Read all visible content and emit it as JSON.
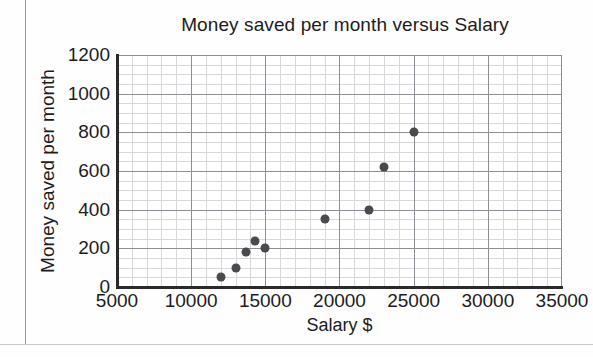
{
  "chart_data": {
    "type": "scatter",
    "title": "Money saved per month versus Salary",
    "xlabel": "Salary $",
    "ylabel": "Money saved per month",
    "xlim": [
      5000,
      35000
    ],
    "ylim": [
      0,
      1200
    ],
    "xticks": [
      "5000",
      "10000",
      "15000",
      "20000",
      "25000",
      "30000",
      "35000"
    ],
    "xtick_values": [
      5000,
      10000,
      15000,
      20000,
      25000,
      30000,
      35000
    ],
    "yticks": [
      "0",
      "200",
      "400",
      "600",
      "800",
      "1000",
      "1200"
    ],
    "ytick_values": [
      0,
      200,
      400,
      600,
      800,
      1000,
      1200
    ],
    "grid": true,
    "grid_minor_x": 1000,
    "grid_minor_y": 50,
    "legend": null,
    "marker_color": "#4a4a4e",
    "points": [
      {
        "x": 12000,
        "y": 50
      },
      {
        "x": 13000,
        "y": 100
      },
      {
        "x": 13700,
        "y": 180
      },
      {
        "x": 14300,
        "y": 240
      },
      {
        "x": 15000,
        "y": 200
      },
      {
        "x": 19000,
        "y": 350
      },
      {
        "x": 22000,
        "y": 400
      },
      {
        "x": 23000,
        "y": 620
      },
      {
        "x": 25000,
        "y": 800
      }
    ]
  }
}
